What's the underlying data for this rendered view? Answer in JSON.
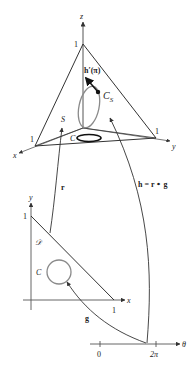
{
  "diagram": {
    "colors": {
      "line": "#333333",
      "curve_gray": "#8a8a8a",
      "ellipse_black": "#111111",
      "background": "#ffffff"
    },
    "top_3d": {
      "axis_z_label": "z",
      "axis_x_label": "x",
      "axis_y_label": "y",
      "tick_z": "1",
      "tick_x": "1",
      "tick_y": "1",
      "surface_label": "S",
      "tangent_label": "h′(π)",
      "curve_on_surface_label": "C",
      "curve_on_surface_subscript": "S",
      "projected_curve_label": "C"
    },
    "mid_arrows": {
      "r_label": "r",
      "h_label": "h = r ∘ g"
    },
    "bottom_2d": {
      "axis_x_label": "x",
      "axis_y_label": "y",
      "tick_x": "1",
      "tick_y": "1",
      "region_label": "𝒟",
      "curve_label": "C",
      "g_label": "g"
    },
    "theta_axis": {
      "axis_label": "θ",
      "tick_0": "0",
      "tick_2pi": "2π"
    }
  }
}
